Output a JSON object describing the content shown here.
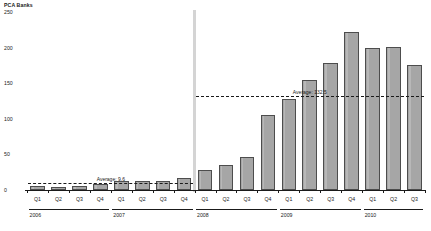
{
  "chart_data": {
    "type": "bar",
    "title": "",
    "ylabel": "PCA Banks",
    "xlabel": "",
    "ylim": [
      0,
      250
    ],
    "yticks": [
      0,
      50,
      100,
      150,
      200,
      250
    ],
    "grid": false,
    "legend": null,
    "categories": [
      "Q1",
      "Q2",
      "Q3",
      "Q4",
      "Q1",
      "Q2",
      "Q3",
      "Q4",
      "Q1",
      "Q2",
      "Q3",
      "Q4",
      "Q1",
      "Q2",
      "Q3",
      "Q4",
      "Q1",
      "Q2",
      "Q3"
    ],
    "values": [
      6,
      4,
      5,
      8,
      12,
      13,
      13,
      17,
      28,
      35,
      47,
      105,
      128,
      155,
      178,
      222,
      200,
      201,
      175
    ],
    "years": [
      {
        "label": "2006",
        "start_index": 0,
        "count": 4
      },
      {
        "label": "2007",
        "start_index": 4,
        "count": 4
      },
      {
        "label": "2008",
        "start_index": 8,
        "count": 4
      },
      {
        "label": "2009",
        "start_index": 12,
        "count": 4
      },
      {
        "label": "2010",
        "start_index": 16,
        "count": 3
      }
    ],
    "annotations": [
      {
        "name": "average-early",
        "text": "Average: 9.6",
        "value": 9.6,
        "span_start_index": 0,
        "span_end_index": 7
      },
      {
        "name": "average-late",
        "text": "Average: 132.5",
        "value": 132.5,
        "span_start_index": 8,
        "span_end_index": 18
      }
    ],
    "divider_after_index": 7,
    "colors": {
      "bar_fill": "#a6a6a6",
      "bar_border": "#4d4d4d",
      "axis": "#1a1a1a",
      "divider": "#d4d4d4"
    }
  }
}
